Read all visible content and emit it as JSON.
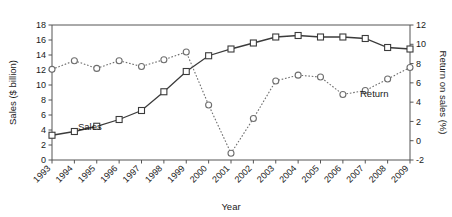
{
  "chart_data": {
    "type": "line",
    "title": "",
    "xlabel": "Year",
    "ylabel": "Sales ($ billion)",
    "y2label": "Return on sales (%)",
    "grid": false,
    "legend_position": "inline-annotation",
    "categories": [
      "1993",
      "1994",
      "1995",
      "1996",
      "1997",
      "1998",
      "1999",
      "2000",
      "2001",
      "2002",
      "2003",
      "2004",
      "2005",
      "2006",
      "2007",
      "2008",
      "2009"
    ],
    "xlim": [
      1993,
      2009
    ],
    "ylim": [
      0,
      18
    ],
    "yticks": [
      0,
      2,
      4,
      6,
      8,
      10,
      12,
      14,
      16,
      18
    ],
    "y2lim": [
      -2,
      12
    ],
    "y2ticks": [
      -2,
      0,
      2,
      4,
      6,
      8,
      10,
      12
    ],
    "series": [
      {
        "name": "Sales",
        "axis": "left",
        "unit": "$ billion",
        "marker": "open-square",
        "linestyle": "solid",
        "values": [
          3.3,
          3.8,
          4.5,
          5.4,
          6.6,
          9.1,
          11.8,
          13.9,
          14.8,
          15.6,
          16.4,
          16.6,
          16.4,
          16.4,
          16.2,
          15.0,
          14.8
        ]
      },
      {
        "name": "Return",
        "axis": "right",
        "unit": "%",
        "marker": "open-circle",
        "linestyle": "dotted",
        "values": [
          7.4,
          8.3,
          7.5,
          8.3,
          7.7,
          8.4,
          9.2,
          3.7,
          -1.3,
          2.3,
          6.2,
          6.8,
          6.6,
          4.8,
          5.2,
          6.4,
          7.6
        ]
      }
    ],
    "annotations": [
      {
        "text": "Sales",
        "series": "Sales"
      },
      {
        "text": "Return",
        "series": "Return"
      }
    ]
  }
}
